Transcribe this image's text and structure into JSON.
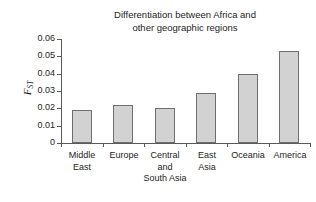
{
  "chart_data": {
    "type": "bar",
    "title": "Differentiation between Africa and\nother geographic regions",
    "xlabel": "",
    "ylabel": "F",
    "ylabel_sub": "ST",
    "categories": [
      "Middle\nEast",
      "Europe",
      "Central\nand\nSouth Asia",
      "East\nAsia",
      "Oceania",
      "America"
    ],
    "values": [
      0.019,
      0.022,
      0.02,
      0.029,
      0.04,
      0.053
    ],
    "ylim": [
      0,
      0.06
    ],
    "yticks": [
      "0",
      "0.01",
      "0.02",
      "0.03",
      "0.04",
      "0.05",
      "0.06"
    ],
    "ytick_values": [
      0,
      0.01,
      0.02,
      0.03,
      0.04,
      0.05,
      0.06
    ],
    "grid": false,
    "legend": false,
    "bar_color": "#d2d2d2",
    "bar_edge_color": "#6e6e6e",
    "axis_color": "#5a5a5a"
  }
}
